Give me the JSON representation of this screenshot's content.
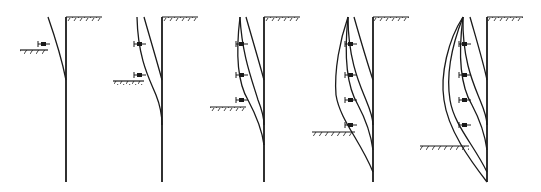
{
  "diagram": {
    "title": "",
    "colors": {
      "line": "#1a1a1a",
      "background": "#ffffff"
    },
    "stages": [
      {
        "index": 1,
        "wall_x": 66,
        "wall_top": 17,
        "wall_bottom": 182,
        "ground_top_y": 17,
        "excavation_y": 50,
        "excavation_left": 20,
        "anchors": [
          {
            "y": 44
          }
        ],
        "curves": [
          "M 48 17 C 56 40, 62 60, 66 80"
        ]
      },
      {
        "index": 2,
        "wall_x": 162,
        "wall_top": 17,
        "wall_bottom": 182,
        "ground_top_y": 17,
        "excavation_y": 81,
        "excavation_left": 113,
        "anchors": [
          {
            "y": 44
          },
          {
            "y": 75
          }
        ],
        "curves": [
          "M 144 17 C 152 45, 158 65, 162 80",
          "M 137 17 C 138 60, 150 80, 156 95 C 160 105, 162 115, 162 125"
        ]
      },
      {
        "index": 3,
        "wall_x": 264,
        "wall_top": 17,
        "wall_bottom": 182,
        "ground_top_y": 17,
        "excavation_y": 107,
        "excavation_left": 210,
        "anchors": [
          {
            "y": 44
          },
          {
            "y": 75
          },
          {
            "y": 100
          }
        ],
        "curves": [
          "M 246 17 C 254 45, 260 65, 264 80",
          "M 240 17 C 242 55, 252 80, 258 100 C 262 110, 264 118, 264 125",
          "M 240 17 C 236 50, 236 80, 248 100 C 256 115, 262 130, 264 145"
        ]
      },
      {
        "index": 4,
        "wall_x": 373,
        "wall_top": 17,
        "wall_bottom": 182,
        "ground_top_y": 17,
        "excavation_y": 132,
        "excavation_left": 312,
        "anchors": [
          {
            "y": 44
          },
          {
            "y": 75
          },
          {
            "y": 100
          },
          {
            "y": 125
          }
        ],
        "curves": [
          "M 354 17 C 362 45, 368 65, 373 80",
          "M 348 17 C 348 60, 360 85, 366 100 C 371 112, 373 120, 373 125",
          "M 348 17 C 344 55, 346 85, 358 105 C 366 120, 371 135, 373 150",
          "M 348 17 C 340 40, 334 70, 336 95 C 340 120, 360 140, 373 172"
        ]
      },
      {
        "index": 5,
        "wall_x": 487,
        "wall_top": 17,
        "wall_bottom": 182,
        "ground_top_y": 17,
        "excavation_y": 146,
        "excavation_left": 420,
        "anchors": [
          {
            "y": 44
          },
          {
            "y": 75
          },
          {
            "y": 100
          },
          {
            "y": 125
          }
        ],
        "curves": [
          "M 470 17 C 478 45, 484 65, 487 80",
          "M 463 17 C 462 60, 474 85, 480 100 C 485 112, 487 120, 487 125",
          "M 463 17 C 458 55, 460 85, 472 105 C 480 120, 485 135, 487 150",
          "M 463 17 C 452 45, 446 75, 450 100 C 454 125, 474 145, 487 172",
          "M 463 17 C 448 40, 440 75, 444 100 C 448 130, 470 160, 487 182"
        ]
      }
    ]
  }
}
